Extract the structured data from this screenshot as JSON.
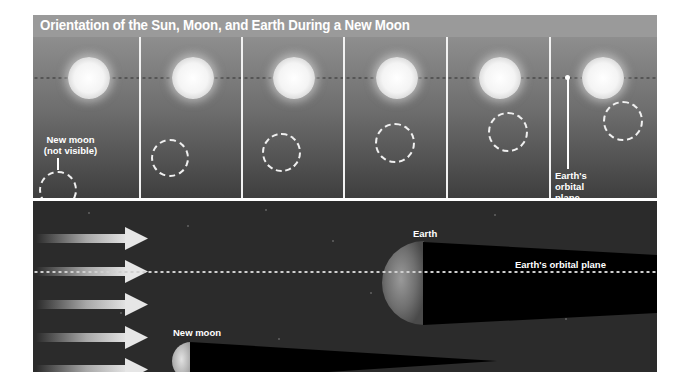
{
  "figure": {
    "title": "Orientation of the Sun, Moon, and Earth During a New Moon",
    "top_row": {
      "panel_count": 6,
      "new_moon_label_line1": "New moon",
      "new_moon_label_line2": "(not visible)",
      "orbital_plane_label_line1": "Earth's",
      "orbital_plane_label_line2": "orbital",
      "orbital_plane_label_line3": "plane"
    },
    "bottom_panel": {
      "earth_label": "Earth",
      "orbital_plane_label": "Earth's orbital plane",
      "new_moon_label": "New moon",
      "sunlight_arrow_count": 5
    },
    "colors": {
      "title_bar": "#9a9a9a",
      "space_background": "#2b2b2b",
      "shadow": "#000000",
      "label_text": "#ffffff"
    }
  }
}
